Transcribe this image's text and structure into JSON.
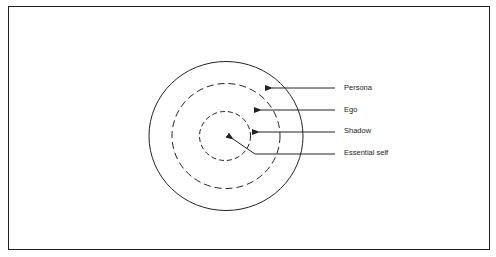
{
  "diagram": {
    "type": "concentric-circles",
    "layers": [
      {
        "name": "Persona",
        "style": "solid",
        "order": 1
      },
      {
        "name": "Ego",
        "style": "dashed",
        "order": 2
      },
      {
        "name": "Shadow",
        "style": "dashed",
        "order": 3
      },
      {
        "name": "Essential self",
        "style": "center",
        "order": 4
      }
    ],
    "labels": {
      "persona": "Persona",
      "ego": "Ego",
      "shadow": "Shadow",
      "essential_self": "Essential self"
    },
    "colors": {
      "stroke": "#222222",
      "background": "#ffffff"
    }
  }
}
